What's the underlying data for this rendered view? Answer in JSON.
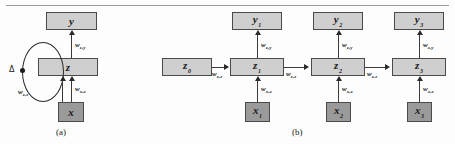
{
  "figure": {
    "type": "diagram",
    "panels": [
      {
        "id": "a",
        "caption": "(a)",
        "nodes": [
          {
            "name": "y",
            "label": "y",
            "sub": "",
            "shade": "light"
          },
          {
            "name": "z",
            "label": "z",
            "sub": "",
            "shade": "light"
          },
          {
            "name": "x",
            "label": "x",
            "sub": "",
            "shade": "dark"
          }
        ],
        "weights": [
          {
            "name": "w-zy",
            "base": "w",
            "sub": "z,y"
          },
          {
            "name": "w-xz",
            "base": "w",
            "sub": "x,z"
          },
          {
            "name": "w-zz",
            "base": "w",
            "sub": "z,z"
          }
        ],
        "delay": {
          "symbol": "Δ"
        }
      },
      {
        "id": "b",
        "caption": "(b)",
        "outputs": [
          {
            "name": "y1",
            "label": "y",
            "sub": "1"
          },
          {
            "name": "y2",
            "label": "y",
            "sub": "2"
          },
          {
            "name": "y3",
            "label": "y",
            "sub": "3"
          }
        ],
        "states": [
          {
            "name": "z0",
            "label": "z",
            "sub": "0"
          },
          {
            "name": "z1",
            "label": "z",
            "sub": "1"
          },
          {
            "name": "z2",
            "label": "z",
            "sub": "2"
          },
          {
            "name": "z3",
            "label": "z",
            "sub": "3"
          }
        ],
        "inputs": [
          {
            "name": "x1",
            "label": "x",
            "sub": "1"
          },
          {
            "name": "x2",
            "label": "x",
            "sub": "2"
          },
          {
            "name": "x3",
            "label": "x",
            "sub": "3"
          }
        ],
        "weights_zy": [
          {
            "base": "w",
            "sub": "z,y"
          },
          {
            "base": "w",
            "sub": "z,y"
          },
          {
            "base": "w",
            "sub": "z,y"
          }
        ],
        "weights_xz": [
          {
            "base": "w",
            "sub": "x,z"
          },
          {
            "base": "w",
            "sub": "x,z"
          },
          {
            "base": "w",
            "sub": "x,z"
          }
        ],
        "weights_zz": [
          {
            "base": "w",
            "sub": "z,z"
          },
          {
            "base": "w",
            "sub": "z,z"
          },
          {
            "base": "w",
            "sub": "z,z"
          }
        ]
      }
    ],
    "colors": {
      "light_box": "#cfcfcf",
      "dark_box": "#9a9a9a",
      "stroke": "#4a4a4a",
      "background": "#fdfdfd"
    }
  }
}
